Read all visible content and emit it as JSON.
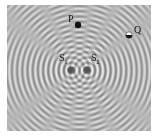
{
  "figure": {
    "type": "two-source interference pattern",
    "background": "#b5b5b5",
    "pattern_rect": {
      "x": 7,
      "y": 5,
      "w": 144,
      "h": 126
    },
    "wavelength_px": 5.2,
    "sources": [
      {
        "id": "S1",
        "label": "S",
        "sub": "1",
        "x": 71,
        "y": 70,
        "label_x": 59,
        "label_y": 53
      },
      {
        "id": "S2",
        "label": "S",
        "sub": "2",
        "x": 87,
        "y": 70,
        "label_x": 91,
        "label_y": 53
      }
    ],
    "points": [
      {
        "id": "P",
        "label": "P",
        "x": 78,
        "y": 25,
        "label_x": 68,
        "label_y": 14,
        "style": "filled"
      },
      {
        "id": "Q",
        "label": "Q",
        "x": 129,
        "y": 35,
        "label_x": 134,
        "label_y": 25,
        "style": "half"
      }
    ]
  }
}
